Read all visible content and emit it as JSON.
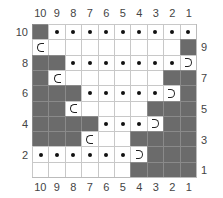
{
  "chart_data": {
    "type": "table",
    "title": "",
    "columns": [
      "10",
      "9",
      "8",
      "7",
      "6",
      "5",
      "4",
      "3",
      "2",
      "1"
    ],
    "rows_top_to_bottom": [
      10,
      9,
      8,
      7,
      6,
      5,
      4,
      3,
      2,
      1
    ],
    "left_row_labels": [
      "10",
      "",
      "8",
      "",
      "6",
      "",
      "4",
      "",
      "2",
      ""
    ],
    "right_row_labels": [
      "",
      "9",
      "",
      "7",
      "",
      "5",
      "",
      "3",
      "",
      "1"
    ],
    "legend_symbols": {
      "shaded": "no stitch / grey",
      "dot": "purl",
      "blank": "knit",
      "wrap-left": "C shaped turn/wrap (left)",
      "wrap-right": "D shaped turn/wrap (right)"
    },
    "cells": [
      [
        "shaded",
        "dot",
        "dot",
        "dot",
        "dot",
        "dot",
        "dot",
        "dot",
        "dot",
        "dot"
      ],
      [
        "wrap-left",
        "blank",
        "blank",
        "blank",
        "blank",
        "blank",
        "blank",
        "blank",
        "blank",
        "shaded"
      ],
      [
        "shaded",
        "shaded",
        "dot",
        "dot",
        "dot",
        "dot",
        "dot",
        "dot",
        "dot",
        "wrap-right"
      ],
      [
        "shaded",
        "wrap-left",
        "blank",
        "blank",
        "blank",
        "blank",
        "blank",
        "blank",
        "shaded",
        "shaded"
      ],
      [
        "shaded",
        "shaded",
        "shaded",
        "dot",
        "dot",
        "dot",
        "dot",
        "dot",
        "wrap-right",
        "shaded"
      ],
      [
        "shaded",
        "shaded",
        "wrap-left",
        "blank",
        "blank",
        "blank",
        "blank",
        "shaded",
        "shaded",
        "shaded"
      ],
      [
        "shaded",
        "shaded",
        "shaded",
        "shaded",
        "dot",
        "dot",
        "dot",
        "wrap-right",
        "shaded",
        "shaded"
      ],
      [
        "shaded",
        "shaded",
        "shaded",
        "wrap-left",
        "blank",
        "blank",
        "shaded",
        "shaded",
        "shaded",
        "shaded"
      ],
      [
        "dot",
        "dot",
        "dot",
        "dot",
        "dot",
        "dot",
        "wrap-right",
        "shaded",
        "shaded",
        "shaded"
      ],
      [
        "blank",
        "blank",
        "blank",
        "blank",
        "blank",
        "blank",
        "shaded",
        "shaded",
        "shaded",
        "shaded"
      ]
    ],
    "colors": {
      "shaded": "#6b6b6b",
      "grid_line": "#c8c8c8",
      "symbol": "#111111"
    }
  },
  "labels": {
    "columns_top": [
      "10",
      "9",
      "8",
      "7",
      "6",
      "5",
      "4",
      "3",
      "2",
      "1"
    ],
    "columns_bottom": [
      "10",
      "9",
      "8",
      "7",
      "6",
      "5",
      "4",
      "3",
      "2",
      "1"
    ],
    "rows_left": [
      {
        "text": "10",
        "row": 0
      },
      {
        "text": "8",
        "row": 2
      },
      {
        "text": "6",
        "row": 4
      },
      {
        "text": "4",
        "row": 6
      },
      {
        "text": "2",
        "row": 8
      }
    ],
    "rows_right": [
      {
        "text": "9",
        "row": 1
      },
      {
        "text": "7",
        "row": 3
      },
      {
        "text": "5",
        "row": 5
      },
      {
        "text": "3",
        "row": 7
      },
      {
        "text": "1",
        "row": 9
      }
    ]
  }
}
